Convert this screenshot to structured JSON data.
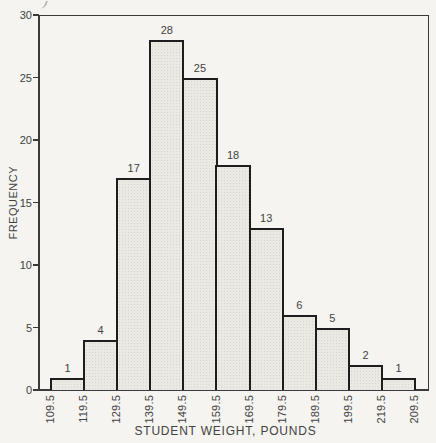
{
  "figure": {
    "x_axis_title": "STUDENT WEIGHT, POUNDS",
    "y_axis_title": "FREQUENCY"
  },
  "chart_data": {
    "type": "bar",
    "subtype": "histogram",
    "title": "",
    "xlabel": "STUDENT WEIGHT, POUNDS",
    "ylabel": "FREQUENCY",
    "bin_edge_labels": [
      "109.5",
      "119.5",
      "129.5",
      "139.5",
      "149.5",
      "159.5",
      "169.5",
      "179.5",
      "189.5",
      "199.5",
      "219.5",
      "209.5"
    ],
    "values": [
      1,
      4,
      17,
      28,
      25,
      18,
      13,
      6,
      5,
      2,
      1
    ],
    "yticks": [
      0,
      5,
      10,
      15,
      20,
      25,
      30
    ],
    "ylim": [
      0,
      30
    ],
    "grid": false,
    "legend": false,
    "bar_labels_shown": true
  },
  "colors": {
    "paper": "#f5f4f0",
    "bar_fill": "#ebe9e3",
    "bar_border": "#1d1d1d",
    "axis_line": "#3a3a3a",
    "text": "#424242"
  }
}
